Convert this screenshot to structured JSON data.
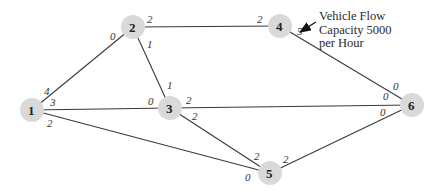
{
  "diagram": {
    "type": "network-flow-graph",
    "colors": {
      "node_fill": "#d9d9d9",
      "edge": "#3a3a3a",
      "text": "#222222"
    },
    "nodes": [
      {
        "id": "1",
        "x": 32,
        "y": 110
      },
      {
        "id": "2",
        "x": 133,
        "y": 27
      },
      {
        "id": "3",
        "x": 170,
        "y": 108
      },
      {
        "id": "4",
        "x": 280,
        "y": 26
      },
      {
        "id": "5",
        "x": 270,
        "y": 173
      },
      {
        "id": "6",
        "x": 412,
        "y": 105
      }
    ],
    "edges": [
      {
        "from": "1",
        "to": "2",
        "capacity_from": "4",
        "capacity_to": "0"
      },
      {
        "from": "1",
        "to": "3",
        "capacity_from": "3",
        "capacity_to": "0"
      },
      {
        "from": "1",
        "to": "5",
        "capacity_from": "2",
        "capacity_to": "0"
      },
      {
        "from": "2",
        "to": "4",
        "capacity_from": "2",
        "capacity_to": "2"
      },
      {
        "from": "2",
        "to": "3",
        "capacity_from": "1",
        "capacity_to": "1"
      },
      {
        "from": "3",
        "to": "6",
        "capacity_from": "2",
        "capacity_to": "0"
      },
      {
        "from": "3",
        "to": "5",
        "capacity_from": "2",
        "capacity_to": "2"
      },
      {
        "from": "4",
        "to": "6",
        "capacity_from": "5",
        "capacity_to": "0"
      },
      {
        "from": "5",
        "to": "6",
        "capacity_from": "2",
        "capacity_to": "0"
      }
    ],
    "annotation": {
      "lines": [
        "Vehicle Flow",
        "Capacity 5000",
        "per Hour"
      ],
      "points_to_edge": "4-6 capacity 5"
    }
  }
}
